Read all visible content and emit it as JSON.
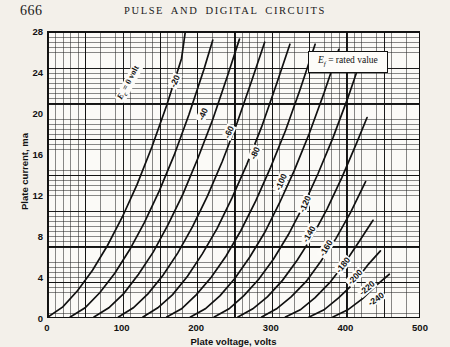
{
  "page": {
    "folio": "666",
    "running_head": "PULSE AND DIGITAL CIRCUITS"
  },
  "legend": {
    "prefix": "E",
    "subscript": "f",
    "text": "= rated value",
    "full": "Ef = rated value"
  },
  "chart_data": {
    "type": "line",
    "title": "",
    "xlabel": "Plate voltage, volts",
    "ylabel": "Plate current, ma",
    "xlim": [
      0,
      500
    ],
    "ylim": [
      0,
      28
    ],
    "xticks": [
      0,
      100,
      200,
      300,
      400,
      500
    ],
    "yticks": [
      0,
      4,
      8,
      12,
      16,
      20,
      24,
      28
    ],
    "grid": "minor-and-major",
    "minor_grid_x_step": 10,
    "minor_grid_y_step": 0.5,
    "legend_position": "top-right",
    "series_label_prefix": "Ec",
    "series": [
      {
        "name": "Ec = 0 volt",
        "label": "Ec = 0 volt",
        "bias": 0,
        "x": [
          0,
          20,
          40,
          60,
          80,
          100,
          120,
          140,
          160,
          180,
          185
        ],
        "y": [
          0,
          1.0,
          2.6,
          4.6,
          7.0,
          9.8,
          13.0,
          16.7,
          20.8,
          25.4,
          28
        ]
      },
      {
        "name": "-20",
        "label": "-20",
        "bias": -20,
        "x": [
          30,
          50,
          70,
          90,
          110,
          130,
          150,
          170,
          190,
          210,
          222
        ],
        "y": [
          0,
          0.9,
          2.4,
          4.3,
          6.6,
          9.3,
          12.4,
          15.9,
          19.9,
          24.3,
          27.2
        ]
      },
      {
        "name": "-40",
        "label": "-40",
        "bias": -40,
        "x": [
          62,
          82,
          102,
          122,
          142,
          162,
          182,
          202,
          222,
          242,
          258
        ],
        "y": [
          0,
          0.9,
          2.3,
          4.2,
          6.4,
          9.1,
          12.1,
          15.6,
          19.4,
          23.7,
          27.3
        ]
      },
      {
        "name": "-60",
        "label": "-60",
        "bias": -60,
        "x": [
          95,
          115,
          135,
          155,
          175,
          195,
          215,
          235,
          255,
          275,
          292
        ],
        "y": [
          0,
          0.9,
          2.3,
          4.1,
          6.3,
          8.9,
          11.9,
          15.3,
          19.1,
          23.3,
          27.0
        ]
      },
      {
        "name": "-80",
        "label": "-80",
        "bias": -80,
        "x": [
          128,
          148,
          168,
          188,
          208,
          228,
          248,
          268,
          288,
          308,
          326
        ],
        "y": [
          0,
          0.9,
          2.2,
          4.0,
          6.2,
          8.7,
          11.7,
          15.0,
          18.7,
          22.9,
          26.8
        ]
      },
      {
        "name": "-100",
        "label": "-100",
        "bias": -100,
        "x": [
          160,
          180,
          200,
          220,
          240,
          260,
          280,
          300,
          320,
          340,
          360
        ],
        "y": [
          0,
          0.8,
          2.2,
          3.9,
          6.0,
          8.5,
          11.4,
          14.7,
          18.3,
          22.4,
          26.8
        ]
      },
      {
        "name": "-120",
        "label": "-120",
        "bias": -120,
        "x": [
          192,
          212,
          232,
          252,
          272,
          292,
          312,
          332,
          352,
          372,
          392
        ],
        "y": [
          0,
          0.8,
          2.1,
          3.8,
          5.9,
          8.3,
          11.2,
          14.4,
          18.0,
          22.0,
          26.3
        ]
      },
      {
        "name": "-140",
        "label": "-140",
        "bias": -140,
        "x": [
          224,
          244,
          264,
          284,
          304,
          324,
          344,
          364,
          384,
          404,
          420
        ],
        "y": [
          0,
          0.8,
          2.1,
          3.7,
          5.7,
          8.1,
          10.9,
          14.1,
          17.6,
          21.5,
          24.9
        ]
      },
      {
        "name": "-160",
        "label": "-160",
        "bias": -160,
        "x": [
          256,
          276,
          296,
          316,
          336,
          356,
          376,
          396,
          416,
          430
        ],
        "y": [
          0,
          0.8,
          2.0,
          3.6,
          5.6,
          7.9,
          10.6,
          13.7,
          17.1,
          19.6
        ]
      },
      {
        "name": "-180",
        "label": "-180",
        "bias": -180,
        "x": [
          288,
          308,
          328,
          348,
          368,
          388,
          408,
          428
        ],
        "y": [
          0,
          0.8,
          2.0,
          3.5,
          5.5,
          7.7,
          10.3,
          13.3
        ]
      },
      {
        "name": "-200",
        "label": "-200",
        "bias": -200,
        "x": [
          320,
          340,
          360,
          380,
          400,
          420,
          438
        ],
        "y": [
          0,
          0.7,
          1.9,
          3.4,
          5.3,
          7.5,
          9.5
        ]
      },
      {
        "name": "-220",
        "label": "-220",
        "bias": -220,
        "x": [
          352,
          372,
          392,
          412,
          432,
          448
        ],
        "y": [
          0,
          0.7,
          1.9,
          3.3,
          5.2,
          6.5
        ]
      },
      {
        "name": "-240",
        "label": "-240",
        "bias": -240,
        "x": [
          384,
          404,
          424,
          444,
          460
        ],
        "y": [
          0,
          0.7,
          1.8,
          3.2,
          4.2
        ]
      }
    ],
    "curve_label_positions": [
      {
        "label": "Ec = 0 volt",
        "x": 108,
        "y": 23.0,
        "angle": -62
      },
      {
        "label": "-20",
        "x": 170,
        "y": 23.2,
        "angle": -66
      },
      {
        "label": "-40",
        "x": 208,
        "y": 20.0,
        "angle": -66
      },
      {
        "label": "-60",
        "x": 243,
        "y": 18.2,
        "angle": -66
      },
      {
        "label": "-80",
        "x": 278,
        "y": 16.2,
        "angle": -66
      },
      {
        "label": "-100",
        "x": 312,
        "y": 13.4,
        "angle": -66
      },
      {
        "label": "-120",
        "x": 345,
        "y": 11.2,
        "angle": -66
      },
      {
        "label": "-140",
        "x": 350,
        "y": 8.3,
        "angle": -60
      },
      {
        "label": "-160",
        "x": 372,
        "y": 6.9,
        "angle": -58
      },
      {
        "label": "-180",
        "x": 396,
        "y": 5.3,
        "angle": -52
      },
      {
        "label": "-200",
        "x": 412,
        "y": 4.1,
        "angle": -46
      },
      {
        "label": "-220",
        "x": 428,
        "y": 3.0,
        "angle": -40
      },
      {
        "label": "-240",
        "x": 440,
        "y": 2.0,
        "angle": -34
      }
    ]
  }
}
